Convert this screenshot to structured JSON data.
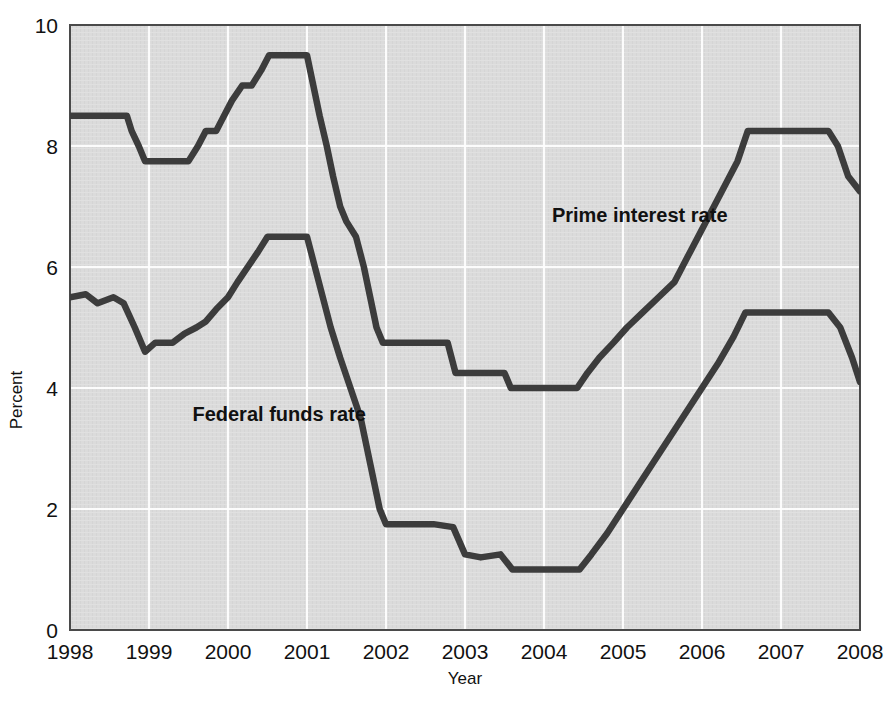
{
  "chart_data": {
    "type": "line",
    "title": "",
    "xlabel": "Year",
    "ylabel": "Percent",
    "xlim": [
      1998,
      2008
    ],
    "ylim": [
      0,
      10
    ],
    "xticks": [
      1998,
      1999,
      2000,
      2001,
      2002,
      2003,
      2004,
      2005,
      2006,
      2007,
      2008
    ],
    "xtick_labels": [
      "1998",
      "1999",
      "2000",
      "2001",
      "2002",
      "2003",
      "2004",
      "2005",
      "2006",
      "2007",
      "2008"
    ],
    "yticks": [
      0,
      2,
      4,
      6,
      8,
      10
    ],
    "ytick_labels": [
      "0",
      "2",
      "4",
      "6",
      "8",
      "10"
    ],
    "grid": true,
    "grid_color": "#ffffff",
    "plot_background": "#d9d9d9",
    "line_color": "#3c3c3c",
    "legend_position": "inline-annotations",
    "series": [
      {
        "name": "Prime interest rate",
        "annotation": "Prime interest rate",
        "annotation_x": 2004.1,
        "annotation_y": 6.75,
        "color": "#3c3c3c",
        "x": [
          1998.0,
          1998.72,
          1998.78,
          1998.87,
          1998.95,
          1999.5,
          1999.62,
          1999.72,
          1999.85,
          1999.95,
          2000.05,
          2000.18,
          2000.3,
          2000.42,
          2000.52,
          2001.0,
          2001.08,
          2001.16,
          2001.25,
          2001.33,
          2001.42,
          2001.5,
          2001.62,
          2001.72,
          2001.8,
          2001.88,
          2001.96,
          2002.2,
          2002.78,
          2002.88,
          2003.0,
          2003.5,
          2003.58,
          2004.42,
          2004.55,
          2004.7,
          2004.88,
          2005.05,
          2005.25,
          2005.45,
          2005.65,
          2005.85,
          2006.05,
          2006.25,
          2006.45,
          2006.58,
          2007.6,
          2007.72,
          2007.85,
          2008.0
        ],
        "y": [
          8.5,
          8.5,
          8.25,
          8.0,
          7.75,
          7.75,
          8.0,
          8.25,
          8.25,
          8.5,
          8.75,
          9.0,
          9.0,
          9.25,
          9.5,
          9.5,
          9.0,
          8.5,
          8.0,
          7.5,
          7.0,
          6.75,
          6.5,
          6.0,
          5.5,
          5.0,
          4.75,
          4.75,
          4.75,
          4.25,
          4.25,
          4.25,
          4.0,
          4.0,
          4.25,
          4.5,
          4.75,
          5.0,
          5.25,
          5.5,
          5.75,
          6.25,
          6.75,
          7.25,
          7.75,
          8.25,
          8.25,
          8.0,
          7.5,
          7.25
        ]
      },
      {
        "name": "Federal funds rate",
        "annotation": "Federal funds rate",
        "annotation_x": 1999.55,
        "annotation_y": 3.45,
        "color": "#3c3c3c",
        "x": [
          1998.0,
          1998.2,
          1998.35,
          1998.55,
          1998.68,
          1998.82,
          1998.95,
          1999.08,
          1999.3,
          1999.45,
          1999.6,
          1999.72,
          1999.85,
          2000.0,
          2000.12,
          2000.25,
          2000.38,
          2000.5,
          2001.0,
          2001.1,
          2001.2,
          2001.3,
          2001.42,
          2001.55,
          2001.68,
          2001.8,
          2001.92,
          2002.0,
          2002.25,
          2002.6,
          2002.85,
          2003.0,
          2003.2,
          2003.45,
          2003.6,
          2004.0,
          2004.45,
          2004.6,
          2004.8,
          2005.0,
          2005.2,
          2005.45,
          2005.7,
          2005.95,
          2006.2,
          2006.4,
          2006.55,
          2007.6,
          2007.75,
          2007.9,
          2008.0
        ],
        "y": [
          5.5,
          5.55,
          5.4,
          5.5,
          5.4,
          5.0,
          4.6,
          4.75,
          4.75,
          4.9,
          5.0,
          5.1,
          5.3,
          5.5,
          5.75,
          6.0,
          6.25,
          6.5,
          6.5,
          6.0,
          5.5,
          5.0,
          4.5,
          4.0,
          3.5,
          2.75,
          2.0,
          1.75,
          1.75,
          1.75,
          1.7,
          1.25,
          1.2,
          1.25,
          1.0,
          1.0,
          1.0,
          1.25,
          1.6,
          2.0,
          2.4,
          2.9,
          3.4,
          3.9,
          4.4,
          4.85,
          5.25,
          5.25,
          5.0,
          4.5,
          4.1
        ]
      }
    ]
  },
  "axes": {
    "y_axis_title": "Percent",
    "x_axis_title": "Year"
  },
  "annotations": {
    "prime": "Prime interest rate",
    "fed_funds": "Federal funds rate"
  }
}
